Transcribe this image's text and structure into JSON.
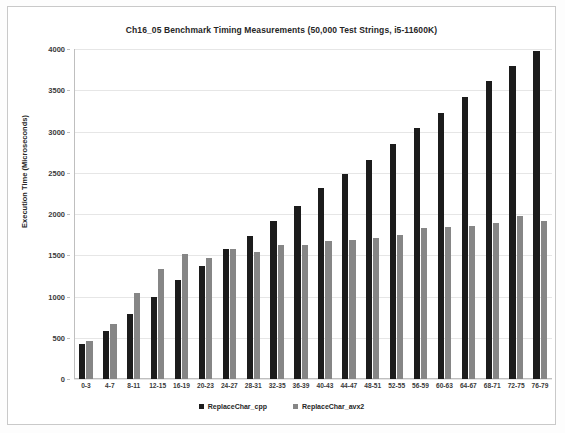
{
  "chart_data": {
    "type": "bar",
    "title": "Ch16_05 Benchmark Timing Measurements (50,000 Test Strings, i5-11600K)",
    "xlabel": "",
    "ylabel": "Execution Time (Microseconds)",
    "ylim": [
      0,
      4000
    ],
    "ytick_step": 500,
    "yticks": [
      "0",
      "500",
      "1000",
      "1500",
      "2000",
      "2500",
      "3000",
      "3500",
      "4000"
    ],
    "grid": true,
    "legend_position": "bottom",
    "categories": [
      "0-3",
      "4-7",
      "8-11",
      "12-15",
      "16-19",
      "20-23",
      "24-27",
      "28-31",
      "32-35",
      "36-39",
      "40-43",
      "44-47",
      "48-51",
      "52-55",
      "56-59",
      "60-63",
      "64-67",
      "68-71",
      "72-75",
      "76-79"
    ],
    "series": [
      {
        "name": "ReplaceChar_cpp",
        "color": "#1c1c1c",
        "values": [
          420,
          580,
          790,
          990,
          1200,
          1370,
          1570,
          1730,
          1910,
          2100,
          2310,
          2480,
          2660,
          2850,
          3040,
          3230,
          3420,
          3610,
          3790,
          3980
        ]
      },
      {
        "name": "ReplaceChar_avx2",
        "color": "#868686",
        "values": [
          465,
          670,
          1040,
          1330,
          1510,
          1470,
          1580,
          1540,
          1620,
          1620,
          1670,
          1680,
          1710,
          1750,
          1830,
          1840,
          1850,
          1890,
          1970,
          1910
        ]
      }
    ]
  }
}
